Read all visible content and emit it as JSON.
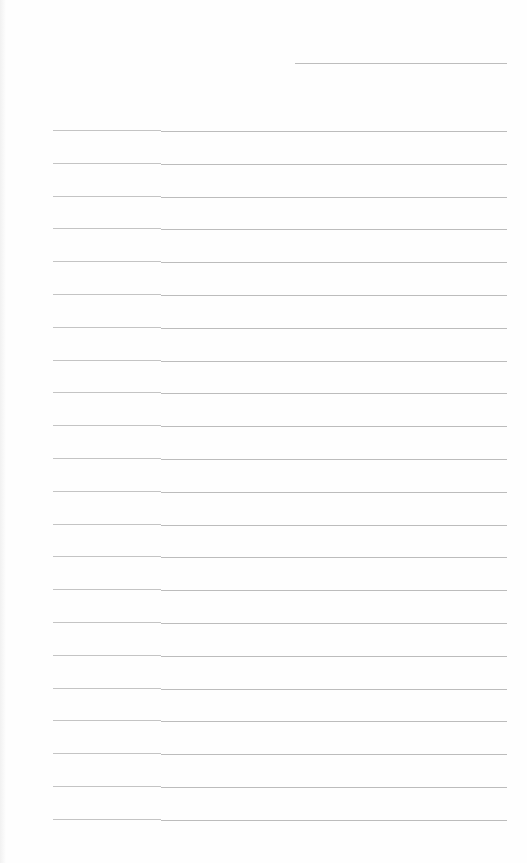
{
  "document": {
    "type": "ruled-form",
    "header_field": {
      "value": ""
    },
    "rows": [
      {
        "left": "",
        "right": ""
      },
      {
        "left": "",
        "right": ""
      },
      {
        "left": "",
        "right": ""
      },
      {
        "left": "",
        "right": ""
      },
      {
        "left": "",
        "right": ""
      },
      {
        "left": "",
        "right": ""
      },
      {
        "left": "",
        "right": ""
      },
      {
        "left": "",
        "right": ""
      },
      {
        "left": "",
        "right": ""
      },
      {
        "left": "",
        "right": ""
      },
      {
        "left": "",
        "right": ""
      },
      {
        "left": "",
        "right": ""
      },
      {
        "left": "",
        "right": ""
      },
      {
        "left": "",
        "right": ""
      },
      {
        "left": "",
        "right": ""
      },
      {
        "left": "",
        "right": ""
      },
      {
        "left": "",
        "right": ""
      },
      {
        "left": "",
        "right": ""
      },
      {
        "left": "",
        "right": ""
      },
      {
        "left": "",
        "right": ""
      },
      {
        "left": "",
        "right": ""
      },
      {
        "left": "",
        "right": ""
      }
    ],
    "line_color": "#bdbdbd",
    "background": "#fefefe"
  }
}
